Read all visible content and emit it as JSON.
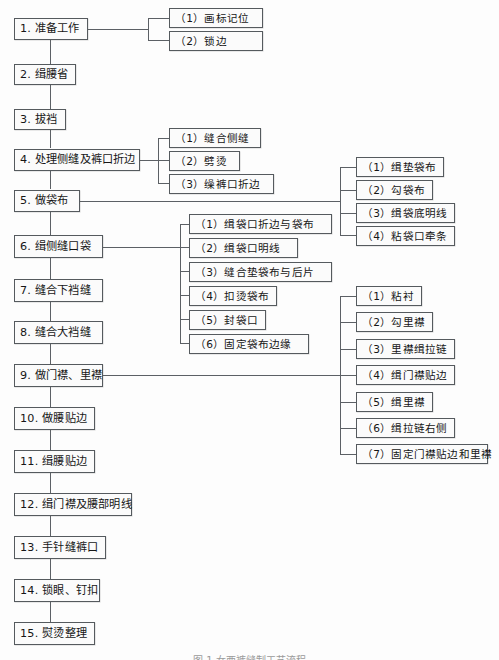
{
  "figure": {
    "caption": "图 1   女西裤缝制工艺流程",
    "type": "flowchart",
    "orientation": "vertical-main-with-right-branches",
    "line_color": "#5c6065",
    "box_border_color": "#555a5e",
    "box_fill_color": "#fbfbfb",
    "text_color": "#161616"
  },
  "main_steps": [
    {
      "id": "s1",
      "label": "1. 准备工作"
    },
    {
      "id": "s2",
      "label": "2. 缉腰省"
    },
    {
      "id": "s3",
      "label": "3. 拔裆"
    },
    {
      "id": "s4",
      "label": "4. 处理侧缝及裤口折边"
    },
    {
      "id": "s5",
      "label": "5. 做袋布"
    },
    {
      "id": "s6",
      "label": "6. 缉侧缝口袋"
    },
    {
      "id": "s7",
      "label": "7. 缝合下裆缝"
    },
    {
      "id": "s8",
      "label": "8. 缝合大裆缝"
    },
    {
      "id": "s9",
      "label": "9. 做门襟、里襟"
    },
    {
      "id": "s10",
      "label": "10. 做腰贴边"
    },
    {
      "id": "s11",
      "label": "11. 缉腰贴边"
    },
    {
      "id": "s12",
      "label": "12. 缉门襟及腰部明线"
    },
    {
      "id": "s13",
      "label": "13. 手针缝裤口"
    },
    {
      "id": "s14",
      "label": "14. 锁眼、钉扣"
    },
    {
      "id": "s15",
      "label": "15. 熨烫整理"
    }
  ],
  "branches": {
    "s1": [
      {
        "label": "（1）画标记位"
      },
      {
        "label": "（2）锁边"
      }
    ],
    "s4": [
      {
        "label": "（1）缝合侧缝"
      },
      {
        "label": "（2）劈烫"
      },
      {
        "label": "（3）缲裤口折边"
      }
    ],
    "s5": [
      {
        "label": "（1）缉垫袋布"
      },
      {
        "label": "（2）勾袋布"
      },
      {
        "label": "（3）缉袋底明线"
      },
      {
        "label": "（4）粘袋口牵条"
      }
    ],
    "s6": [
      {
        "label": "（1）缉袋口折边与袋布"
      },
      {
        "label": "（2）缉袋口明线"
      },
      {
        "label": "（3）缝合垫袋布与后片"
      },
      {
        "label": "（4）扣烫袋布"
      },
      {
        "label": "（5）封袋口"
      },
      {
        "label": "（6）固定袋布边缘"
      }
    ],
    "s9": [
      {
        "label": "（1）粘衬"
      },
      {
        "label": "（2）勾里襟"
      },
      {
        "label": "（3）里襟缉拉链"
      },
      {
        "label": "（4）缉门襟贴边"
      },
      {
        "label": "（5）缉里襟"
      },
      {
        "label": "（6）缉拉链右侧"
      },
      {
        "label": "（7）固定门襟贴边和里襟"
      }
    ]
  }
}
